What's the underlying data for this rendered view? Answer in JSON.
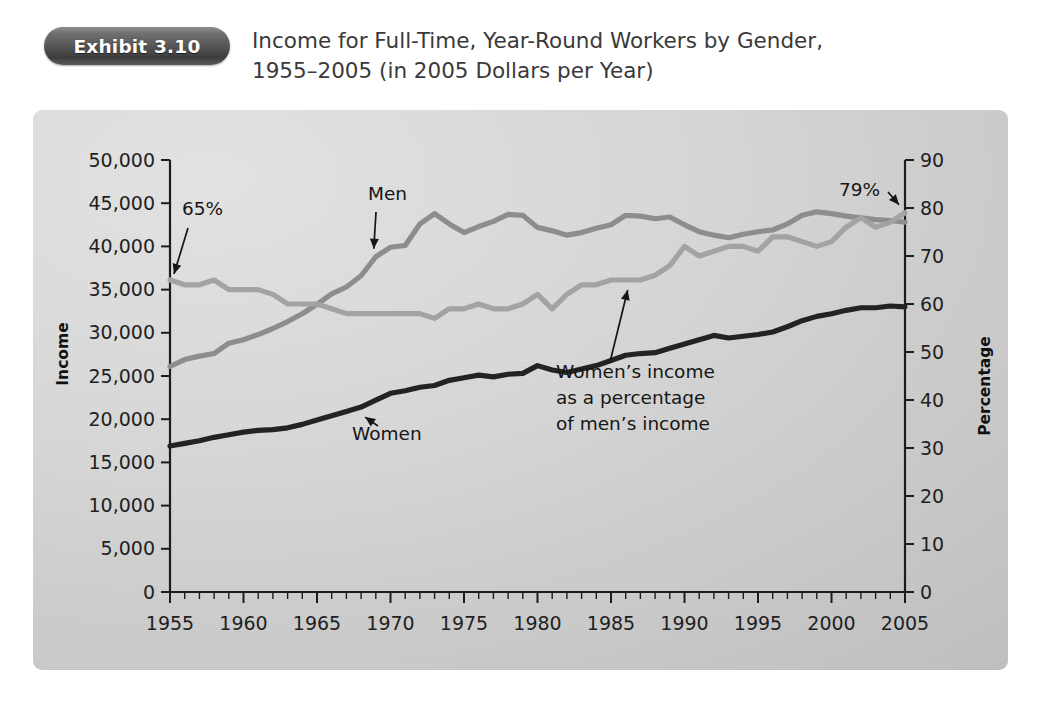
{
  "header": {
    "badge_label": "Exhibit 3.10",
    "title_line1": "Income for Full-Time, Year-Round Workers by Gender,",
    "title_line2": "1955–2005 (in 2005 Dollars per Year)"
  },
  "colors": {
    "badge": "#545454",
    "panel": "#d8d8d8",
    "men_line": "#8d8d8d",
    "ratio_line": "#a3a3a3",
    "women_line": "#232323",
    "axis": "#1c1c1c",
    "text": "#1f1f1f"
  },
  "chart_data": {
    "type": "line",
    "title": "Income for Full-Time, Year-Round Workers by Gender, 1955–2005 (in 2005 Dollars per Year)",
    "xlabel": "",
    "ylabel": "Income",
    "y2label": "Percentage",
    "xlim": [
      1955,
      2005
    ],
    "ylim": [
      0,
      50000
    ],
    "y2lim": [
      0,
      90
    ],
    "grid": false,
    "legend": "none",
    "x_ticks": [
      1955,
      1960,
      1965,
      1970,
      1975,
      1980,
      1985,
      1990,
      1995,
      2000,
      2005
    ],
    "x_tick_labels": [
      "1955",
      "1960",
      "1965",
      "1970",
      "1975",
      "1980",
      "1985",
      "1990",
      "1995",
      "2000",
      "2005"
    ],
    "x_minor_tick_step": 1,
    "y_ticks": [
      0,
      5000,
      10000,
      15000,
      20000,
      25000,
      30000,
      35000,
      40000,
      45000,
      50000
    ],
    "y_tick_labels": [
      "0",
      "5,000",
      "10,000",
      "15,000",
      "20,000",
      "25,000",
      "30,000",
      "35,000",
      "40,000",
      "45,000",
      "50,000"
    ],
    "y2_ticks": [
      0,
      10,
      20,
      30,
      40,
      50,
      60,
      70,
      80,
      90
    ],
    "y2_tick_labels": [
      "0",
      "10",
      "20",
      "30",
      "40",
      "50",
      "60",
      "70",
      "80",
      "90"
    ],
    "x": [
      1955,
      1956,
      1957,
      1958,
      1959,
      1960,
      1961,
      1962,
      1963,
      1964,
      1965,
      1966,
      1967,
      1968,
      1969,
      1970,
      1971,
      1972,
      1973,
      1974,
      1975,
      1976,
      1977,
      1978,
      1979,
      1980,
      1981,
      1982,
      1983,
      1984,
      1985,
      1986,
      1987,
      1988,
      1989,
      1990,
      1991,
      1992,
      1993,
      1994,
      1995,
      1996,
      1997,
      1998,
      1999,
      2000,
      2001,
      2002,
      2003,
      2004,
      2005
    ],
    "series": [
      {
        "name": "Men",
        "axis": "left",
        "color": "#8d8d8d",
        "values": [
          26100,
          26900,
          27300,
          27600,
          28800,
          29200,
          29800,
          30500,
          31300,
          32200,
          33300,
          34500,
          35300,
          36600,
          38800,
          39900,
          40100,
          42600,
          43800,
          42600,
          41600,
          42300,
          42900,
          43700,
          43600,
          42200,
          41800,
          41300,
          41600,
          42100,
          42500,
          43600,
          43500,
          43200,
          43400,
          42500,
          41700,
          41300,
          41000,
          41400,
          41700,
          41900,
          42600,
          43600,
          44000,
          43800,
          43500,
          43300,
          43100,
          43000,
          42800
        ]
      },
      {
        "name": "Women",
        "axis": "left",
        "color": "#232323",
        "values": [
          16900,
          17200,
          17500,
          17900,
          18200,
          18500,
          18700,
          18800,
          19000,
          19400,
          19900,
          20400,
          20900,
          21400,
          22200,
          23000,
          23300,
          23700,
          23900,
          24500,
          24800,
          25100,
          24900,
          25200,
          25300,
          26200,
          25700,
          25400,
          25800,
          26200,
          26800,
          27400,
          27600,
          27700,
          28200,
          28700,
          29200,
          29700,
          29400,
          29600,
          29800,
          30100,
          30700,
          31400,
          31900,
          32200,
          32600,
          32900,
          32900,
          33100,
          33000
        ]
      },
      {
        "name": "Women's income as a percentage of men's income",
        "axis": "right",
        "color": "#a3a3a3",
        "values": [
          65,
          64,
          64,
          65,
          63,
          63,
          63,
          62,
          60,
          60,
          60,
          59,
          58,
          58,
          58,
          58,
          58,
          58,
          57,
          59,
          59,
          60,
          59,
          59,
          60,
          62,
          59,
          62,
          64,
          64,
          65,
          65,
          65,
          66,
          68,
          72,
          70,
          71,
          72,
          72,
          71,
          74,
          74,
          73,
          72,
          73,
          76,
          78,
          76,
          77,
          79
        ]
      }
    ],
    "annotations": [
      {
        "id": "pct-start",
        "text": "65%",
        "points_to_year": 1955,
        "points_to_value": 65,
        "axis": "right"
      },
      {
        "id": "pct-end",
        "text": "79%",
        "points_to_year": 2005,
        "points_to_value": 79,
        "axis": "right"
      },
      {
        "id": "men-label",
        "text": "Men",
        "points_to_year": 1969,
        "points_to_value": 38800,
        "axis": "left"
      },
      {
        "id": "women-label",
        "text": "Women",
        "points_to_year": 1968,
        "points_to_value": 21400,
        "axis": "left"
      },
      {
        "id": "ratio-label",
        "text_lines": [
          "Women’s income",
          "as a percentage",
          "of men’s income"
        ],
        "points_to_year": 1986,
        "points_to_value": 65,
        "axis": "right"
      }
    ]
  }
}
